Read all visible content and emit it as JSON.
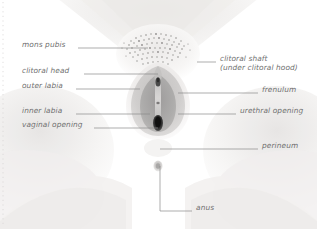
{
  "figure": {
    "type": "anatomical-diagram",
    "background_color": "#ffffff",
    "label_color": "#6f6f6f",
    "leader_line_color": "#8a8a8a",
    "skin_tone": "#f2f0ef",
    "labia_tone": "#c9c7c6",
    "inner_tone": "#a9a7a7",
    "opening_tone": "#2b2b2b",
    "hair_tone": "#8d8d8d"
  },
  "labels": {
    "left": [
      {
        "id": "mons-pubis",
        "text": "mons pubis",
        "x": 22,
        "y": 44,
        "line_x1": 78,
        "line_x2": 148,
        "line_y": 48
      },
      {
        "id": "clitoral-head",
        "text": "clitoral head",
        "x": 22,
        "y": 70,
        "line_x1": 84,
        "line_x2": 158,
        "line_y": 74
      },
      {
        "id": "outer-labia",
        "text": "outer labia",
        "x": 22,
        "y": 85,
        "line_x1": 76,
        "line_x2": 140,
        "line_y": 89
      },
      {
        "id": "inner-labia",
        "text": "inner labia",
        "x": 22,
        "y": 110,
        "line_x1": 76,
        "line_x2": 150,
        "line_y": 114
      },
      {
        "id": "vaginal-opening",
        "text": "vaginal opening",
        "x": 22,
        "y": 124,
        "line_x1": 94,
        "line_x2": 158,
        "line_y": 128
      }
    ],
    "right": [
      {
        "id": "clitoral-shaft",
        "text": "clitoral shaft",
        "text2": "(under clitoral hood)",
        "x": 220,
        "y": 58,
        "line_x1": 197,
        "line_x2": 216,
        "line_y": 62
      },
      {
        "id": "frenulum",
        "text": "frenulum",
        "x": 262,
        "y": 89,
        "line_x1": 178,
        "line_x2": 258,
        "line_y": 93
      },
      {
        "id": "urethral-opening",
        "text": "urethral opening",
        "x": 240,
        "y": 110,
        "line_x1": 178,
        "line_x2": 236,
        "line_y": 114
      },
      {
        "id": "perineum",
        "text": "perineum",
        "x": 262,
        "y": 145,
        "line_x1": 160,
        "line_x2": 258,
        "line_y": 149
      }
    ],
    "bottom": [
      {
        "id": "anus",
        "text": "anus",
        "x": 196,
        "y": 207,
        "line_x": 160,
        "line_y1": 166,
        "line_y2": 211,
        "line_x2": 192
      }
    ]
  }
}
